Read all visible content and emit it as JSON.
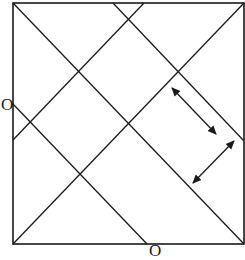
{
  "diagram": {
    "type": "geometric-line-diagram",
    "stroke_color": "#1a1a1a",
    "background": "#ffffff",
    "square": {
      "x1": 13,
      "y1": 3,
      "x2": 244,
      "y2": 244
    },
    "lines": [
      {
        "name": "main-diagonal",
        "x1": 13,
        "y1": 3,
        "x2": 244,
        "y2": 244
      },
      {
        "name": "anti-diagonal",
        "x1": 13,
        "y1": 244,
        "x2": 244,
        "y2": 3
      },
      {
        "name": "upper-right-parallel",
        "x1": 113,
        "y1": 3,
        "x2": 244,
        "y2": 141
      },
      {
        "name": "upper-left-parallel",
        "x1": 144,
        "y1": 3,
        "x2": 13,
        "y2": 140
      },
      {
        "name": "lower-left-parallel",
        "x1": 13,
        "y1": 104,
        "x2": 147,
        "y2": 244
      }
    ],
    "arrows": [
      {
        "name": "double-arrow-1",
        "x1": 172,
        "y1": 88,
        "x2": 216,
        "y2": 134
      },
      {
        "name": "double-arrow-2",
        "x1": 193,
        "y1": 183,
        "x2": 234,
        "y2": 141
      }
    ],
    "labels": [
      {
        "name": "label-left-O",
        "text": "O",
        "x": 1,
        "y": 96
      },
      {
        "name": "label-bottom-O",
        "text": "O",
        "x": 149,
        "y": 242
      }
    ]
  }
}
